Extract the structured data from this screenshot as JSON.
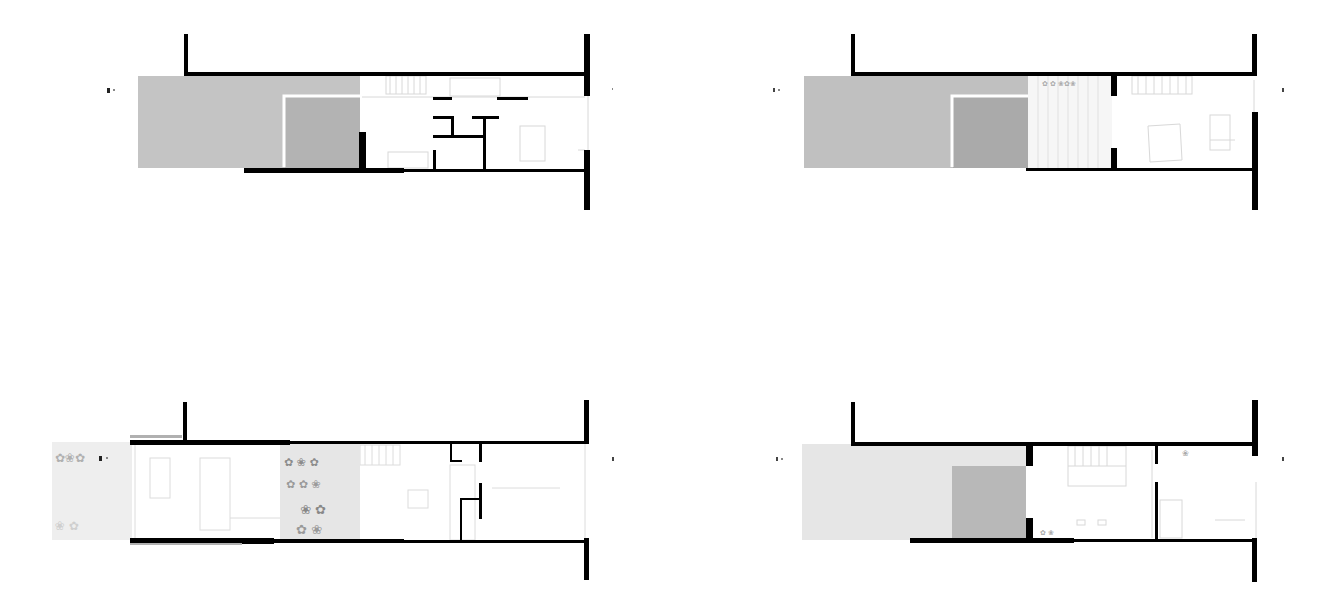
{
  "drawing": {
    "type": "architectural-floor-plans",
    "layout": "2x2 grid",
    "colors": {
      "background": "#ffffff",
      "wall": "#000000",
      "paving_dark": "#b4b4b4",
      "paving_mid": "#c8c8c8",
      "paving_light": "#e8e8e8",
      "furniture_line": "#cfcfcf",
      "planting": "#a8a8a8"
    },
    "section_marker": "▮·",
    "plans": [
      {
        "id": "plan-top-left",
        "position": "top-left",
        "description": "Ground level with grey paved courtyard, raised planter, stair and small rooms"
      },
      {
        "id": "plan-top-right",
        "position": "top-right",
        "description": "Level with grey paved terrace, planted zone and one room"
      },
      {
        "id": "plan-bottom-left",
        "position": "bottom-left",
        "description": "Level with planted garden strip, living space, planted patio and service core"
      },
      {
        "id": "plan-bottom-right",
        "position": "bottom-right",
        "description": "Level with light terrace, grey planter, stair room and bedroom"
      }
    ]
  }
}
